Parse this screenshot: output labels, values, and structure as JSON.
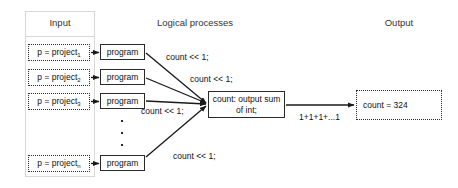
{
  "columns": {
    "input": "Input",
    "processes": "Logical processes",
    "output": "Output"
  },
  "inputs": [
    {
      "label": "p = project",
      "index": "1"
    },
    {
      "label": "p = project",
      "index": "2"
    },
    {
      "label": "p = project",
      "index": "3"
    },
    {
      "label": "p = project",
      "index": "n"
    }
  ],
  "programs": [
    {
      "label": "program"
    },
    {
      "label": "program"
    },
    {
      "label": "program"
    },
    {
      "label": "program"
    }
  ],
  "aggregator": {
    "line1": "count: output sum",
    "line2": "of int;"
  },
  "output": {
    "value": "count = 324"
  },
  "edge_labels": {
    "process_1": "count << 1;",
    "process_2": "count << 1;",
    "process_3": "count << 1;",
    "process_n": "count << 1;",
    "output_edge": "1+1+1+...1"
  },
  "ellipsis": {
    "glyph": "vertical-ellipsis",
    "dots": 3
  },
  "colors": {
    "stroke": "#2a2a2a",
    "column_border": "#d8d8d8",
    "text": "#111111",
    "header_text": "#333333",
    "background": "#ffffff"
  }
}
